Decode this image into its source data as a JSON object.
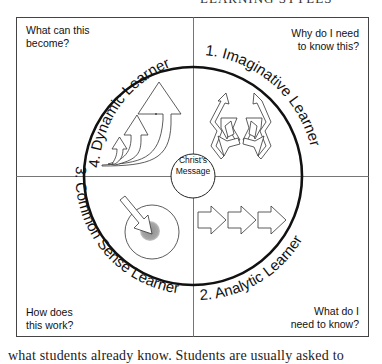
{
  "header": {
    "partial_title": "LEARNING STYLES"
  },
  "diagram": {
    "center": {
      "line1": "Christ's",
      "line2": "Message"
    },
    "quadrants": {
      "top_left": {
        "question_line1": "What can this",
        "question_line2": "become?",
        "learner": "4. Dynamic Learner",
        "icon": "rising-arrows-icon"
      },
      "top_right": {
        "question_line1": "Why do I need",
        "question_line2": "to know this?",
        "learner": "1. Imaginative Learner",
        "icon": "scattered-arrows-icon"
      },
      "bottom_left": {
        "question_line1": "How does",
        "question_line2": "this work?",
        "learner": "3. Common Sense Learner",
        "icon": "target-arrow-icon"
      },
      "bottom_right": {
        "question_line1": "What do I",
        "question_line2": "need to know?",
        "learner": "2. Analytic Learner",
        "icon": "sequential-arrows-icon"
      }
    }
  },
  "footer": {
    "partial_text": "what students already know. Students are usually asked to"
  },
  "colors": {
    "line": "#111111",
    "divider": "#555555",
    "target_fill": "#9a9a9a"
  }
}
